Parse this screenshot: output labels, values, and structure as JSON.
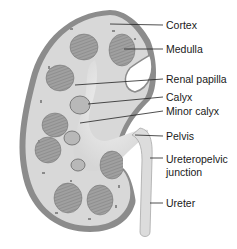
{
  "figure": {
    "colors": {
      "capsule": "#8a8a8a",
      "cortex": "#d9d9d9",
      "medulla": "#9c9c9c",
      "pelvis": "#e6e6e6",
      "line": "#222222"
    }
  },
  "labels": [
    {
      "id": "cortex",
      "text": "Cortex",
      "y": 19
    },
    {
      "id": "medulla",
      "text": "Medulla",
      "y": 43
    },
    {
      "id": "renal-papilla",
      "text": "Renal papilla",
      "y": 73
    },
    {
      "id": "calyx",
      "text": "Calyx",
      "y": 91
    },
    {
      "id": "minor-calyx",
      "text": "Minor calyx",
      "y": 105
    },
    {
      "id": "pelvis",
      "text": "Pelvis",
      "y": 130
    },
    {
      "id": "ureteropelvic-junction-1",
      "text": "Ureteropelvic",
      "y": 153
    },
    {
      "id": "ureteropelvic-junction-2",
      "text": "junction",
      "y": 166
    },
    {
      "id": "ureter",
      "text": "Ureter",
      "y": 197
    }
  ]
}
